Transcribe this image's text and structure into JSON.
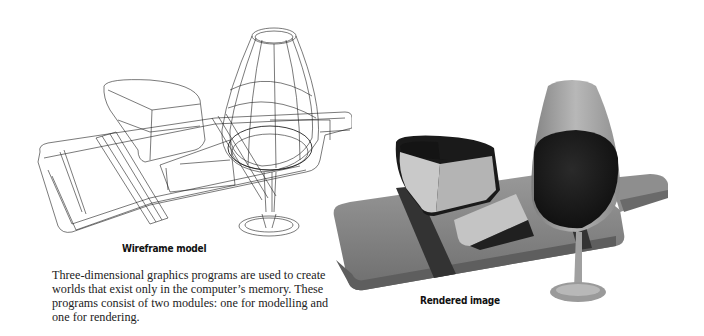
{
  "figures": {
    "wireframe": {
      "caption": "Wireframe model",
      "subject": "wine glass, cheese wedge and cheese block on a cutting board",
      "style": "line drawing"
    },
    "rendered": {
      "caption": "Rendered image",
      "subject": "wine glass filled with red wine, cheese wedge and cheese block on a cutting board",
      "style": "shaded grayscale render",
      "colors": {
        "board": "#8a8a8a",
        "board_dark_stripe": "#3a3a3a",
        "cheese_face": "#c8c8c8",
        "cheese_rind": "#1a1a1a",
        "glass": "#9a9a9a",
        "wine": "#1c1c1c"
      }
    }
  },
  "body": {
    "paragraph": "Three-dimensional graphics programs are used to create worlds that exist only in the computer’s memory. These programs consist of two modules: one for modelling and one for rendering."
  }
}
